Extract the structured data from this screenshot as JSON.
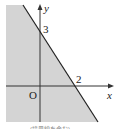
{
  "diagram": {
    "type": "inequality-region-plot",
    "colors": {
      "shade": "#d4d4d4",
      "line": "#222222",
      "axis": "#333333",
      "background": "#ffffff"
    },
    "axes": {
      "x_label": "x",
      "y_label": "y",
      "origin_label": "O"
    },
    "intercepts": {
      "y_intercept_label": "3",
      "x_intercept_label": "2"
    },
    "boundary_line": "y = -3/2 x + 3",
    "shaded_side": "below-left of line",
    "caption": "(境界線を含む)"
  }
}
